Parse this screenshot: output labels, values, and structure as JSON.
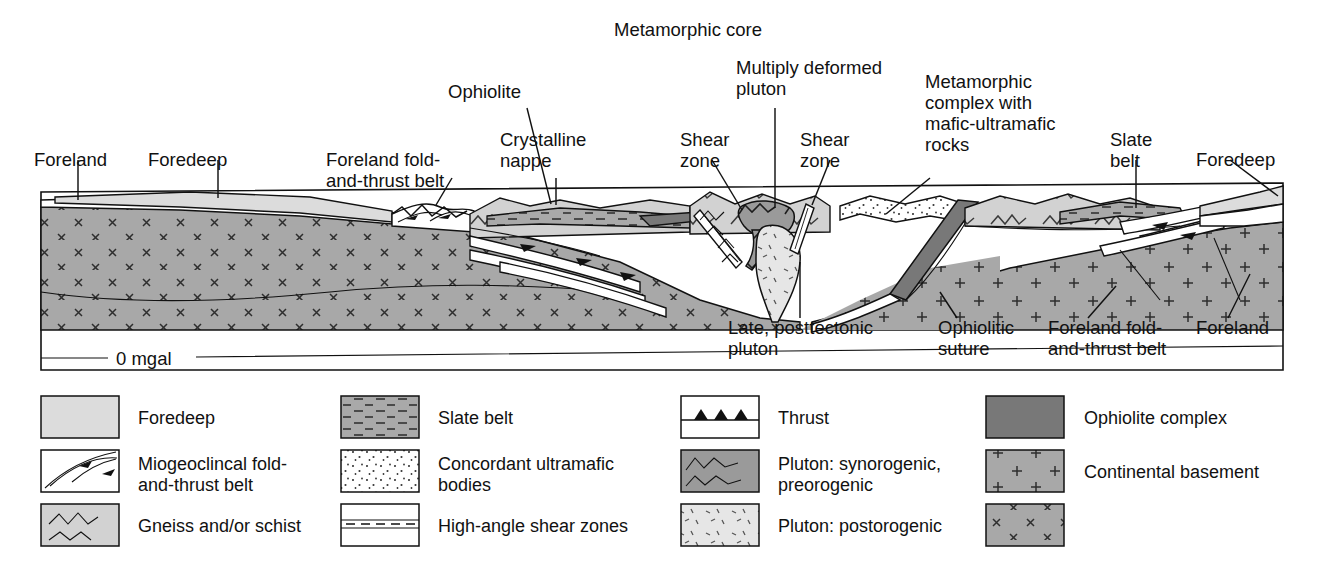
{
  "figure": {
    "title_top": "Metamorphic core",
    "gravity_label": "0 mgal"
  },
  "top_labels": [
    {
      "id": "foreland-left",
      "text": "Foreland"
    },
    {
      "id": "foredeep-left",
      "text": "Foredeep"
    },
    {
      "id": "foreland-fold-and-thrust-belt-left",
      "line1": "Foreland fold-",
      "line2": "and-thrust belt"
    },
    {
      "id": "ophiolite",
      "text": "Ophiolite"
    },
    {
      "id": "crystalline-nappe",
      "line1": "Crystalline",
      "line2": "nappe"
    },
    {
      "id": "shear-zone-left",
      "line1": "Shear",
      "line2": "zone"
    },
    {
      "id": "multiply-deformed-pluton",
      "line1": "Multiply deformed",
      "line2": "pluton"
    },
    {
      "id": "shear-zone-right",
      "line1": "Shear",
      "line2": "zone"
    },
    {
      "id": "metamorphic-complex",
      "line1": "Metamorphic",
      "line2": "complex with",
      "line3": "mafic-ultramafic",
      "line4": "rocks"
    },
    {
      "id": "slate-belt",
      "line1": "Slate",
      "line2": "belt"
    },
    {
      "id": "foredeep-right",
      "text": "Foredeep"
    }
  ],
  "bottom_labels": [
    {
      "id": "late-posttectonic-pluton",
      "line1": "Late, posttectonic",
      "line2": "pluton"
    },
    {
      "id": "ophiolitic-suture",
      "line1": "Ophiolitic",
      "line2": "suture"
    },
    {
      "id": "foreland-fold-and-thrust-belt-right",
      "line1": "Foreland fold-",
      "line2": "and-thrust belt"
    },
    {
      "id": "foreland-right",
      "text": "Foreland"
    }
  ],
  "legend": {
    "columns": [
      {
        "id": "legend-column-1",
        "items": [
          {
            "id": "foredeep",
            "label": "Foredeep",
            "pattern": "solid-light",
            "fill": "#dcdcdc"
          },
          {
            "id": "miogeoclinal-fold-and-thrust-belt",
            "line1": "Miogeoclincal fold-",
            "line2": "and-thrust belt",
            "pattern": "thrust-arrows",
            "fill": "#ffffff"
          },
          {
            "id": "gneiss-and-or-schist",
            "label": "Gneiss and/or schist",
            "pattern": "zigzag",
            "fill": "#d2d2d2"
          }
        ]
      },
      {
        "id": "legend-column-2",
        "items": [
          {
            "id": "slate-belt",
            "label": "Slate belt",
            "pattern": "dashes",
            "fill": "#a9a9a9"
          },
          {
            "id": "concordant-ultramafic-bodies",
            "line1": "Concordant ultramafic",
            "line2": "bodies",
            "pattern": "stipple",
            "fill": "#ffffff"
          },
          {
            "id": "high-angle-shear-zones",
            "label": "High-angle shear zones",
            "pattern": "shear-lines",
            "fill": "#ffffff"
          }
        ]
      },
      {
        "id": "legend-column-3",
        "items": [
          {
            "id": "thrust",
            "label": "Thrust",
            "pattern": "thrust-teeth",
            "fill": "#ffffff"
          },
          {
            "id": "pluton-synorogenic-preorogenic",
            "line1": "Pluton: synorogenic,",
            "line2": "preorogenic",
            "pattern": "squiggle",
            "fill": "#9a9a9a"
          },
          {
            "id": "pluton-postorogenic",
            "label": "Pluton: postorogenic",
            "pattern": "dash-flecks",
            "fill": "#e6e6e6"
          }
        ]
      },
      {
        "id": "legend-column-4",
        "items": [
          {
            "id": "ophiolite-complex",
            "label": "Ophiolite complex",
            "pattern": "solid-dark",
            "fill": "#787878"
          },
          {
            "id": "continental-basement",
            "label": "Continental basement",
            "pattern": "plus",
            "fill": "#a8a8a8"
          },
          {
            "id": "basement-x-pattern",
            "label": "",
            "pattern": "cross-x",
            "fill": "#a8a8a8"
          }
        ]
      }
    ]
  },
  "colors": {
    "foredeep_light": "#dcdcdc",
    "gneiss_gray": "#d2d2d2",
    "slate_gray": "#a9a9a9",
    "basement_gray": "#a8a8a8",
    "ophiolite_dark": "#787878",
    "pluton_syn": "#9a9a9a",
    "pluton_post": "#e6e6e6",
    "white": "#ffffff",
    "ink": "#111111"
  }
}
